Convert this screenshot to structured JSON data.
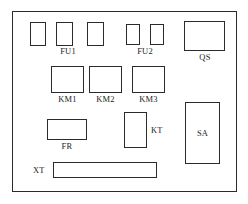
{
  "diagram": {
    "type": "panel-layout",
    "stroke_color": "#2b2b2b",
    "background_color": "#ffffff",
    "enclosure": {
      "name": "panel-enclosure",
      "x": 12,
      "y": 11,
      "width": 225,
      "height": 181
    },
    "components": [
      {
        "id": "fu1-1",
        "label": "",
        "x": 30,
        "y": 22,
        "width": 16,
        "height": 24
      },
      {
        "id": "fu1-2",
        "label": "",
        "x": 56,
        "y": 22,
        "width": 17,
        "height": 24
      },
      {
        "id": "fu1-3",
        "label": "",
        "x": 87,
        "y": 22,
        "width": 17,
        "height": 24
      },
      {
        "id": "fu2-1",
        "label": "",
        "x": 126,
        "y": 24,
        "width": 14,
        "height": 21
      },
      {
        "id": "fu2-2",
        "label": "",
        "x": 150,
        "y": 24,
        "width": 14,
        "height": 21
      },
      {
        "id": "qs",
        "label": "QS",
        "x": 184,
        "y": 21,
        "width": 41,
        "height": 30
      },
      {
        "id": "km1",
        "label": "KM1",
        "x": 51,
        "y": 66,
        "width": 33,
        "height": 27
      },
      {
        "id": "km2",
        "label": "KM2",
        "x": 89,
        "y": 66,
        "width": 33,
        "height": 27
      },
      {
        "id": "km3",
        "label": "KM3",
        "x": 132,
        "y": 66,
        "width": 33,
        "height": 27
      },
      {
        "id": "fr",
        "label": "FR",
        "x": 47,
        "y": 119,
        "width": 40,
        "height": 21
      },
      {
        "id": "kt",
        "label": "KT",
        "x": 124,
        "y": 112,
        "width": 23,
        "height": 36
      },
      {
        "id": "sa",
        "label": "SA",
        "x": 185,
        "y": 102,
        "width": 35,
        "height": 62
      },
      {
        "id": "xt",
        "label": "XT",
        "x": 53,
        "y": 162,
        "width": 104,
        "height": 16
      }
    ],
    "labels": [
      {
        "id": "label-fu1",
        "text": "FU1",
        "x": 52,
        "y": 47,
        "width": 32,
        "align": "center"
      },
      {
        "id": "label-fu2",
        "text": "FU2",
        "x": 129,
        "y": 47,
        "width": 32,
        "align": "center"
      },
      {
        "id": "label-qs",
        "text": "QS",
        "x": 189,
        "y": 53,
        "width": 32,
        "align": "center"
      },
      {
        "id": "label-km1",
        "text": "KM1",
        "x": 51,
        "y": 95,
        "width": 33,
        "align": "center"
      },
      {
        "id": "label-km2",
        "text": "KM2",
        "x": 89,
        "y": 95,
        "width": 33,
        "align": "center"
      },
      {
        "id": "label-km3",
        "text": "KM3",
        "x": 132,
        "y": 95,
        "width": 33,
        "align": "center"
      },
      {
        "id": "label-fr",
        "text": "FR",
        "x": 51,
        "y": 142,
        "width": 32,
        "align": "center"
      },
      {
        "id": "label-kt",
        "text": "KT",
        "x": 151,
        "y": 126,
        "width": 20,
        "align": "left"
      },
      {
        "id": "label-sa",
        "text": "SA",
        "x": 185,
        "y": 102,
        "width": 35,
        "align": "inside"
      },
      {
        "id": "label-xt",
        "text": "XT",
        "x": 33,
        "y": 166,
        "width": 16,
        "align": "left"
      }
    ]
  }
}
